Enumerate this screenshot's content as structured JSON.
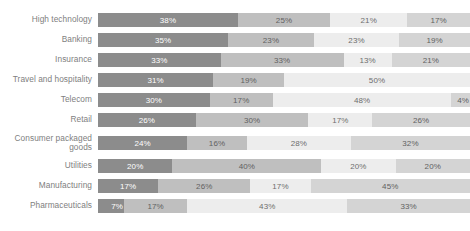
{
  "chart_data": {
    "type": "bar",
    "subtype": "stacked-horizontal-100",
    "title": "",
    "xlabel": "",
    "ylabel": "",
    "xlim": [
      0,
      100
    ],
    "grid": false,
    "legend": "none",
    "value_suffix": "%",
    "categories": [
      "High technology",
      "Banking",
      "Insurance",
      "Travel and hospitality",
      "Telecom",
      "Retail",
      "Consumer packaged goods",
      "Utilities",
      "Manufacturing",
      "Pharmaceuticals"
    ],
    "series": [
      {
        "name": "Segment 1",
        "color": "#8c8c8c",
        "values": [
          38,
          35,
          33,
          31,
          30,
          26,
          24,
          20,
          17,
          7
        ]
      },
      {
        "name": "Segment 2",
        "color": "#bfbfbf",
        "values": [
          25,
          23,
          33,
          19,
          17,
          30,
          16,
          40,
          26,
          17
        ]
      },
      {
        "name": "Segment 3",
        "color": "#ededed",
        "values": [
          21,
          23,
          13,
          50,
          48,
          17,
          28,
          20,
          17,
          43
        ]
      },
      {
        "name": "Segment 4",
        "color": "#d4d4d4",
        "values": [
          17,
          19,
          21,
          null,
          4,
          26,
          32,
          20,
          45,
          33
        ]
      }
    ]
  },
  "rows": [
    {
      "label": "High technology",
      "label_line2": "",
      "segments": [
        {
          "value": 38,
          "text": "38%",
          "shade": "s0"
        },
        {
          "value": 25,
          "text": "25%",
          "shade": "s1"
        },
        {
          "value": 21,
          "text": "21%",
          "shade": "s2"
        },
        {
          "value": 17,
          "text": "17%",
          "shade": "s3"
        }
      ]
    },
    {
      "label": "Banking",
      "label_line2": "",
      "segments": [
        {
          "value": 35,
          "text": "35%",
          "shade": "s0"
        },
        {
          "value": 23,
          "text": "23%",
          "shade": "s1"
        },
        {
          "value": 23,
          "text": "23%",
          "shade": "s2"
        },
        {
          "value": 19,
          "text": "19%",
          "shade": "s3"
        }
      ]
    },
    {
      "label": "Insurance",
      "label_line2": "",
      "segments": [
        {
          "value": 33,
          "text": "33%",
          "shade": "s0"
        },
        {
          "value": 33,
          "text": "33%",
          "shade": "s1"
        },
        {
          "value": 13,
          "text": "13%",
          "shade": "s2"
        },
        {
          "value": 21,
          "text": "21%",
          "shade": "s3"
        }
      ]
    },
    {
      "label": "Travel and hospitality",
      "label_line2": "",
      "segments": [
        {
          "value": 31,
          "text": "31%",
          "shade": "s0"
        },
        {
          "value": 19,
          "text": "19%",
          "shade": "s1"
        },
        {
          "value": 50,
          "text": "50%",
          "shade": "s2"
        }
      ]
    },
    {
      "label": "Telecom",
      "label_line2": "",
      "segments": [
        {
          "value": 30,
          "text": "30%",
          "shade": "s0"
        },
        {
          "value": 17,
          "text": "17%",
          "shade": "s1"
        },
        {
          "value": 48,
          "text": "48%",
          "shade": "s2"
        },
        {
          "value": 5,
          "text": "4%",
          "shade": "s3"
        }
      ]
    },
    {
      "label": "Retail",
      "label_line2": "",
      "segments": [
        {
          "value": 26,
          "text": "26%",
          "shade": "s0"
        },
        {
          "value": 30,
          "text": "30%",
          "shade": "s1"
        },
        {
          "value": 17,
          "text": "17%",
          "shade": "s2"
        },
        {
          "value": 26,
          "text": "26%",
          "shade": "s3"
        }
      ]
    },
    {
      "label": "Consumer packaged",
      "label_line2": "goods",
      "segments": [
        {
          "value": 24,
          "text": "24%",
          "shade": "s0"
        },
        {
          "value": 16,
          "text": "16%",
          "shade": "s1"
        },
        {
          "value": 28,
          "text": "28%",
          "shade": "s2"
        },
        {
          "value": 32,
          "text": "32%",
          "shade": "s3"
        }
      ]
    },
    {
      "label": "Utilities",
      "label_line2": "",
      "segments": [
        {
          "value": 20,
          "text": "20%",
          "shade": "s0"
        },
        {
          "value": 40,
          "text": "40%",
          "shade": "s1"
        },
        {
          "value": 20,
          "text": "20%",
          "shade": "s2"
        },
        {
          "value": 20,
          "text": "20%",
          "shade": "s3"
        }
      ]
    },
    {
      "label": "Manufacturing",
      "label_line2": "",
      "segments": [
        {
          "value": 17,
          "text": "17%",
          "shade": "s0"
        },
        {
          "value": 26,
          "text": "26%",
          "shade": "s1"
        },
        {
          "value": 17,
          "text": "17%",
          "shade": "s2"
        },
        {
          "value": 45,
          "text": "45%",
          "shade": "s3"
        }
      ]
    },
    {
      "label": "Pharmaceuticals",
      "label_line2": "",
      "segments": [
        {
          "value": 7,
          "text": "7%",
          "shade": "s0"
        },
        {
          "value": 17,
          "text": "17%",
          "shade": "s1"
        },
        {
          "value": 43,
          "text": "43%",
          "shade": "s2"
        },
        {
          "value": 33,
          "text": "33%",
          "shade": "s3"
        }
      ]
    }
  ]
}
